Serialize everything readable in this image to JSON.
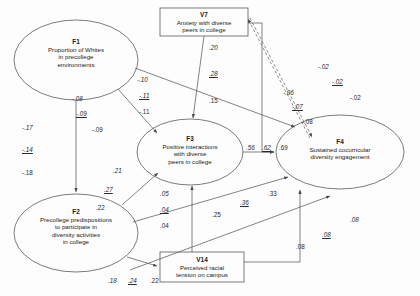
{
  "diagram": {
    "type": "path-diagram"
  },
  "nodes": [
    {
      "id": "F1",
      "code": "F1",
      "label": "Proportion of Whites in precollege environments",
      "lines": [
        "Proportion of Whites",
        "in precollege",
        "environments"
      ],
      "shape": "ellipse",
      "cx": 76,
      "cy": 60,
      "rx": 62,
      "ry": 40
    },
    {
      "id": "F2",
      "code": "F2",
      "label": "Precollege predispositions to participate in diversity activities in college",
      "lines": [
        "Precollege predispositions",
        "to participate in",
        "diversity activities",
        "in college"
      ],
      "shape": "ellipse",
      "cx": 76,
      "cy": 233,
      "rx": 62,
      "ry": 39
    },
    {
      "id": "F3",
      "code": "F3",
      "label": "Positive interactions with diverse peers in college",
      "lines": [
        "Positive interactions",
        "with diverse",
        "peers in college"
      ],
      "shape": "ellipse",
      "cx": 190,
      "cy": 152,
      "rx": 53,
      "ry": 33
    },
    {
      "id": "F4",
      "code": "F4",
      "label": "Sustained cocurricular diversity engagement",
      "lines": [
        "Sustained cocurricular",
        "diversity engagement"
      ],
      "shape": "ellipse",
      "cx": 340,
      "cy": 152,
      "rx": 64,
      "ry": 37
    },
    {
      "id": "V7",
      "code": "V7",
      "label": "Anxiety with diverse peers in college",
      "lines": [
        "Anxiety with diverse",
        "peers in college"
      ],
      "shape": "rect",
      "x": 160,
      "y": 8,
      "w": 88,
      "h": 28
    },
    {
      "id": "V14",
      "code": "V14",
      "label": "Perceived racial tension on campus",
      "lines": [
        "Perceived racial",
        "tension on campus"
      ],
      "shape": "rect",
      "x": 160,
      "y": 252,
      "w": 84,
      "h": 30
    }
  ],
  "coefficients": [
    {
      "id": "f1-f2",
      "from": "F1",
      "to": "F2",
      "values": [
        "-.17",
        "-.14",
        "-.18"
      ],
      "styles": [
        "italic",
        "underline",
        "plain"
      ]
    },
    {
      "id": "f1-f3",
      "from": "F1",
      "to": "F3",
      "values": [
        "-.08",
        "-.09",
        "-.09"
      ],
      "styles": [
        "italic",
        "underline",
        "plain"
      ]
    },
    {
      "id": "f1-f4",
      "from": "F1",
      "to": "F4",
      "values": [
        "-.10",
        "-.11",
        "-.11"
      ],
      "styles": [
        "italic",
        "underline",
        "plain"
      ]
    },
    {
      "id": "v7-f3",
      "from": "V7",
      "to": "F3",
      "values": [
        ".20",
        ".28",
        ".15"
      ],
      "styles": [
        "italic",
        "underline",
        "plain"
      ]
    },
    {
      "id": "f2-f3",
      "from": "F2",
      "to": "F3",
      "values": [
        ".21",
        ".27",
        ".22"
      ],
      "styles": [
        "italic",
        "underline",
        "plain"
      ]
    },
    {
      "id": "f2-v14",
      "from": "F2",
      "to": "V14",
      "values": [
        ".05",
        ".04",
        ".04"
      ],
      "styles": [
        "italic",
        "underline",
        "plain"
      ]
    },
    {
      "id": "v14-f3",
      "from": "V14",
      "to": "F3",
      "values": [
        ".25"
      ],
      "styles": [
        "plain"
      ]
    },
    {
      "id": "f3-f4",
      "from": "F3",
      "to": "F4",
      "values": [
        ".56",
        ".62",
        ".69"
      ],
      "styles": [
        "italic",
        "underline",
        "plain"
      ]
    },
    {
      "id": "f2-f4",
      "from": "F2",
      "to": "F4",
      "values": [
        ".36",
        ".33"
      ],
      "styles": [
        "underline",
        "plain"
      ]
    },
    {
      "id": "v7-f4",
      "from": "V7",
      "to": "F4",
      "values": [
        "-.06",
        "-.07",
        "-.08"
      ],
      "styles": [
        "italic",
        "underline",
        "plain"
      ]
    },
    {
      "id": "v7-f4-dashed",
      "from": "V7",
      "to": "F4",
      "values": [
        "-.02",
        "-.02",
        "-.02"
      ],
      "styles": [
        "italic",
        "underline",
        "plain"
      ],
      "dashed": true
    },
    {
      "id": "v14-f4",
      "from": "V14",
      "to": "F4",
      "values": [
        ".08",
        ".08",
        ".08"
      ],
      "styles": [
        "italic",
        "underline",
        "plain"
      ]
    },
    {
      "id": "f2-v14-b",
      "from": "F2",
      "to": "V14",
      "values": [
        ".18",
        ".24",
        ".22"
      ],
      "styles": [
        "italic",
        "underline",
        "plain"
      ]
    }
  ],
  "labels": {
    "c_f1f2_1": "-.17",
    "c_f1f2_2": "-.14",
    "c_f1f2_3": "-.18",
    "c_f1f3_1": "-.08",
    "c_f1f3_2": "-.09",
    "c_f1f3_3": "-.09",
    "c_f1f4_1": "-.10",
    "c_f1f4_2": "-.11",
    "c_f1f4_3": "-.11",
    "c_v7f3_1": ".20",
    "c_v7f3_2": ".28",
    "c_v7f3_3": ".15",
    "c_f2f3_1": ".21",
    "c_f2f3_2": ".27",
    "c_f2f3_3": ".22",
    "c_f2v14a_1": ".05",
    "c_f2v14a_2": ".04",
    "c_f2v14a_3": ".04",
    "c_v14f3_1": ".25",
    "c_f3f4_1": ".56",
    "c_f3f4_2": ".62",
    "c_f3f4_3": ".69",
    "c_f2f4_1": ".36",
    "c_f2f4_2": ".33",
    "c_v7f4_1": "-.06",
    "c_v7f4_2": "-.07",
    "c_v7f4_3": "-.08",
    "c_dash_1": "-.02",
    "c_dash_2": "-.02",
    "c_dash_3": "-.02",
    "c_v14f4_1": ".08",
    "c_v14f4_2": ".08",
    "c_v14f4_3": ".08",
    "c_f2v14b_1": ".18",
    "c_f2v14b_2": ".24",
    "c_f2v14b_3": ".22"
  },
  "node_text": {
    "F1": {
      "code": "F1",
      "l1": "Proportion of Whites",
      "l2": "in precollege",
      "l3": "environments"
    },
    "F2": {
      "code": "F2",
      "l1": "Precollege predispositions",
      "l2": "to participate in",
      "l3": "diversity activities",
      "l4": "in college"
    },
    "F3": {
      "code": "F3",
      "l1": "Positive interactions",
      "l2": "with diverse",
      "l3": "peers in college"
    },
    "F4": {
      "code": "F4",
      "l1": "Sustained cocurricular",
      "l2": "diversity engagement"
    },
    "V7": {
      "code": "V7",
      "l1": "Anxiety with diverse",
      "l2": "peers in college"
    },
    "V14": {
      "code": "V14",
      "l1": "Perceived racial",
      "l2": "tension on campus"
    }
  }
}
